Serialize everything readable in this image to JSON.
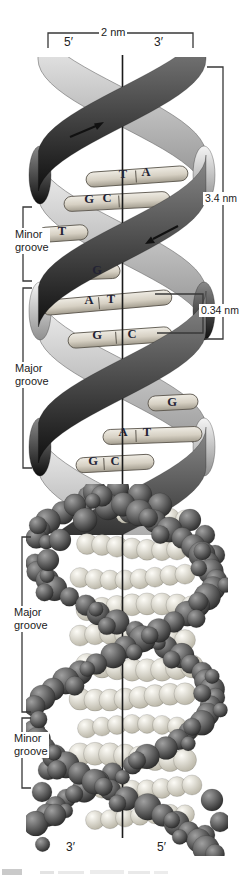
{
  "labels": {
    "diameter": "2 nm",
    "turn": "3.4 nm",
    "rise": "0.34 nm",
    "top_left_prime": "5′",
    "top_right_prime": "3′",
    "bottom_left_prime": "3′",
    "bottom_right_prime": "5′"
  },
  "grooves": [
    {
      "l1": "Minor",
      "l2": "groove"
    },
    {
      "l1": "Major",
      "l2": "groove"
    },
    {
      "l1": "Major",
      "l2": "groove"
    },
    {
      "l1": "Minor",
      "l2": "groove"
    }
  ],
  "bases": {
    "r1a": "T",
    "r1b": "A",
    "r2a": "G",
    "r2b": "C",
    "r3a": "T",
    "r4a": "G",
    "r5a": "A",
    "r5b": "T",
    "r6a": "G",
    "r6b": "C",
    "r7a": "G",
    "r8a": "A",
    "r8b": "T",
    "r9a": "G",
    "r9b": "C"
  },
  "colors": {
    "background": "#ffffff",
    "line": "#383838",
    "axis": "#1a1a1a",
    "ribbon_dark_start": "#8a8a8a",
    "ribbon_dark_end": "#0f0f0f",
    "ribbon_light_start": "#f5f5f5",
    "ribbon_light_end": "#8f8f8f",
    "rung_top": "#efece4",
    "rung_bottom": "#a39d8f",
    "rung_stroke": "#5c574e",
    "sphere_dark_hi": "#a0a0a0",
    "sphere_dark_lo": "#2b2b2b",
    "sphere_light_hi": "#fdfcf7",
    "sphere_light_lo": "#b8b4a5",
    "text": "#222222",
    "base_letter": "#232334"
  }
}
